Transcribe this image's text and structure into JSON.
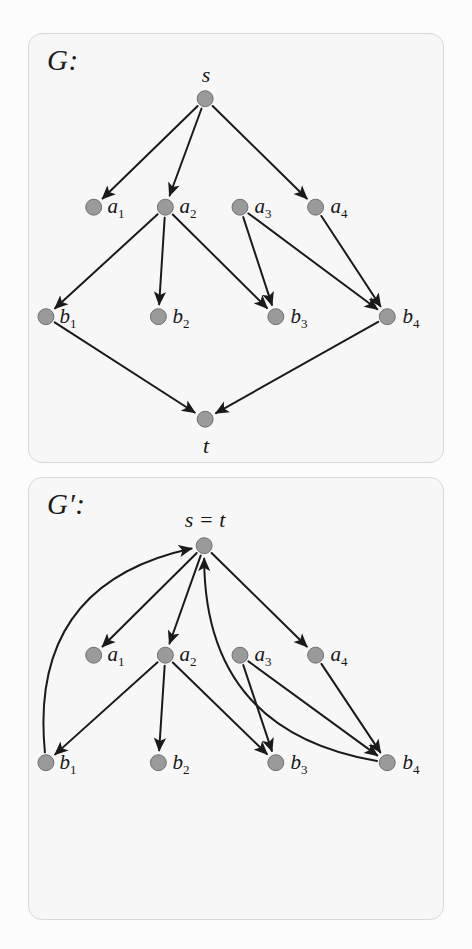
{
  "figure": {
    "kind": "directed-graph-pair",
    "background": "#fcfcfc",
    "panel_fill": "#f7f7f7",
    "panel_border": "#d8d8d8",
    "node_fill": "#9a9a9a",
    "node_stroke": "#6f6f6f",
    "edge_color": "#1a1a1a",
    "node_radius": 8
  },
  "panels": [
    {
      "id": "G",
      "title": "G:",
      "nodes": [
        {
          "id": "s",
          "label": "s",
          "sub": "",
          "x": 177,
          "y": 65,
          "label_dx": 0,
          "label_dy": -24
        },
        {
          "id": "a1",
          "label": "a",
          "sub": "1",
          "x": 65,
          "y": 174,
          "label_dx": 22,
          "label_dy": 0
        },
        {
          "id": "a2",
          "label": "a",
          "sub": "2",
          "x": 137,
          "y": 174,
          "label_dx": 22,
          "label_dy": 0
        },
        {
          "id": "a3",
          "label": "a",
          "sub": "3",
          "x": 212,
          "y": 174,
          "label_dx": 22,
          "label_dy": 0
        },
        {
          "id": "a4",
          "label": "a",
          "sub": "4",
          "x": 288,
          "y": 174,
          "label_dx": 22,
          "label_dy": 0
        },
        {
          "id": "b1",
          "label": "b",
          "sub": "1",
          "x": 17,
          "y": 284,
          "label_dx": 22,
          "label_dy": 0
        },
        {
          "id": "b2",
          "label": "b",
          "sub": "2",
          "x": 130,
          "y": 284,
          "label_dx": 22,
          "label_dy": 0
        },
        {
          "id": "b3",
          "label": "b",
          "sub": "3",
          "x": 248,
          "y": 284,
          "label_dx": 22,
          "label_dy": 0
        },
        {
          "id": "b4",
          "label": "b",
          "sub": "4",
          "x": 360,
          "y": 284,
          "label_dx": 22,
          "label_dy": 0
        },
        {
          "id": "t",
          "label": "t",
          "sub": "",
          "x": 177,
          "y": 387,
          "label_dx": 0,
          "label_dy": 25
        }
      ],
      "edges": [
        {
          "from": "s",
          "to": "a1",
          "curve": 0
        },
        {
          "from": "s",
          "to": "a2",
          "curve": 0
        },
        {
          "from": "s",
          "to": "a4",
          "curve": 0
        },
        {
          "from": "a2",
          "to": "b1",
          "curve": 0
        },
        {
          "from": "a2",
          "to": "b2",
          "curve": 0
        },
        {
          "from": "a2",
          "to": "b3",
          "curve": 0
        },
        {
          "from": "a3",
          "to": "b3",
          "curve": 0
        },
        {
          "from": "a3",
          "to": "b4",
          "curve": 0
        },
        {
          "from": "a4",
          "to": "b4",
          "curve": 0
        },
        {
          "from": "b1",
          "to": "t",
          "curve": 0
        },
        {
          "from": "b4",
          "to": "t",
          "curve": 0
        }
      ]
    },
    {
      "id": "Gprime",
      "title": "G′:",
      "merged_label": "s = t",
      "nodes": [
        {
          "id": "s",
          "label": "s = t",
          "sub": "",
          "x": 176,
          "y": 68,
          "label_dx": 0,
          "label_dy": -26
        },
        {
          "id": "a1",
          "label": "a",
          "sub": "1",
          "x": 65,
          "y": 178,
          "label_dx": 22,
          "label_dy": 0
        },
        {
          "id": "a2",
          "label": "a",
          "sub": "2",
          "x": 137,
          "y": 178,
          "label_dx": 22,
          "label_dy": 0
        },
        {
          "id": "a3",
          "label": "a",
          "sub": "3",
          "x": 212,
          "y": 178,
          "label_dx": 22,
          "label_dy": 0
        },
        {
          "id": "a4",
          "label": "a",
          "sub": "4",
          "x": 288,
          "y": 178,
          "label_dx": 22,
          "label_dy": 0
        },
        {
          "id": "b1",
          "label": "b",
          "sub": "1",
          "x": 17,
          "y": 286,
          "label_dx": 22,
          "label_dy": 0
        },
        {
          "id": "b2",
          "label": "b",
          "sub": "2",
          "x": 130,
          "y": 286,
          "label_dx": 22,
          "label_dy": 0
        },
        {
          "id": "b3",
          "label": "b",
          "sub": "3",
          "x": 248,
          "y": 286,
          "label_dx": 22,
          "label_dy": 0
        },
        {
          "id": "b4",
          "label": "b",
          "sub": "4",
          "x": 360,
          "y": 286,
          "label_dx": 22,
          "label_dy": 0
        }
      ],
      "edges": [
        {
          "from": "s",
          "to": "a1",
          "curve": 0
        },
        {
          "from": "s",
          "to": "a2",
          "curve": 0
        },
        {
          "from": "s",
          "to": "a4",
          "curve": 0
        },
        {
          "from": "a2",
          "to": "b1",
          "curve": 0
        },
        {
          "from": "a2",
          "to": "b2",
          "curve": 0
        },
        {
          "from": "a2",
          "to": "b3",
          "curve": 0
        },
        {
          "from": "a3",
          "to": "b3",
          "curve": 0
        },
        {
          "from": "a3",
          "to": "b4",
          "curve": 0
        },
        {
          "from": "a4",
          "to": "b4",
          "curve": 0
        },
        {
          "from": "b1",
          "to": "s",
          "curve": -120
        },
        {
          "from": "b4",
          "to": "s",
          "curve": -120
        }
      ]
    }
  ],
  "chart_data": {
    "type": "diagram",
    "graphs": [
      {
        "name": "G",
        "vertices": [
          "s",
          "a1",
          "a2",
          "a3",
          "a4",
          "b1",
          "b2",
          "b3",
          "b4",
          "t"
        ],
        "edges": [
          [
            "s",
            "a1"
          ],
          [
            "s",
            "a2"
          ],
          [
            "s",
            "a4"
          ],
          [
            "a2",
            "b1"
          ],
          [
            "a2",
            "b2"
          ],
          [
            "a2",
            "b3"
          ],
          [
            "a3",
            "b3"
          ],
          [
            "a3",
            "b4"
          ],
          [
            "a4",
            "b4"
          ],
          [
            "b1",
            "t"
          ],
          [
            "b4",
            "t"
          ]
        ],
        "directed": true
      },
      {
        "name": "G'",
        "vertices": [
          "s=t",
          "a1",
          "a2",
          "a3",
          "a4",
          "b1",
          "b2",
          "b3",
          "b4"
        ],
        "edges": [
          [
            "s=t",
            "a1"
          ],
          [
            "s=t",
            "a2"
          ],
          [
            "s=t",
            "a4"
          ],
          [
            "a2",
            "b1"
          ],
          [
            "a2",
            "b2"
          ],
          [
            "a2",
            "b3"
          ],
          [
            "a3",
            "b3"
          ],
          [
            "a3",
            "b4"
          ],
          [
            "a4",
            "b4"
          ],
          [
            "b1",
            "s=t"
          ],
          [
            "b4",
            "s=t"
          ]
        ],
        "directed": true,
        "note": "s and t identified into a single vertex; b1 and b4 edges curve back to it"
      }
    ]
  },
  "ghost_text_lines": [
    {
      "x": 36,
      "y": 44,
      "w": 170
    },
    {
      "x": 228,
      "y": 44,
      "w": 200
    },
    {
      "x": 36,
      "y": 63,
      "w": 392
    },
    {
      "x": 36,
      "y": 82,
      "w": 120
    },
    {
      "x": 36,
      "y": 130,
      "w": 392
    },
    {
      "x": 36,
      "y": 149,
      "w": 300
    },
    {
      "x": 36,
      "y": 196,
      "w": 392
    },
    {
      "x": 36,
      "y": 215,
      "w": 392
    },
    {
      "x": 36,
      "y": 234,
      "w": 392
    },
    {
      "x": 36,
      "y": 253,
      "w": 392
    },
    {
      "x": 36,
      "y": 272,
      "w": 392
    },
    {
      "x": 36,
      "y": 291,
      "w": 392
    },
    {
      "x": 36,
      "y": 310,
      "w": 392
    },
    {
      "x": 36,
      "y": 329,
      "w": 392
    },
    {
      "x": 36,
      "y": 348,
      "w": 260
    },
    {
      "x": 36,
      "y": 490,
      "w": 392
    },
    {
      "x": 36,
      "y": 509,
      "w": 392
    },
    {
      "x": 36,
      "y": 528,
      "w": 392
    },
    {
      "x": 36,
      "y": 547,
      "w": 392
    },
    {
      "x": 36,
      "y": 566,
      "w": 392
    },
    {
      "x": 36,
      "y": 585,
      "w": 392
    },
    {
      "x": 36,
      "y": 604,
      "w": 392
    },
    {
      "x": 36,
      "y": 623,
      "w": 392
    },
    {
      "x": 36,
      "y": 642,
      "w": 392
    },
    {
      "x": 36,
      "y": 661,
      "w": 392
    },
    {
      "x": 36,
      "y": 680,
      "w": 392
    },
    {
      "x": 36,
      "y": 699,
      "w": 392
    },
    {
      "x": 36,
      "y": 718,
      "w": 392
    },
    {
      "x": 36,
      "y": 737,
      "w": 392
    },
    {
      "x": 36,
      "y": 756,
      "w": 392
    },
    {
      "x": 36,
      "y": 775,
      "w": 392
    },
    {
      "x": 36,
      "y": 794,
      "w": 392
    },
    {
      "x": 36,
      "y": 813,
      "w": 392
    },
    {
      "x": 36,
      "y": 832,
      "w": 240
    },
    {
      "x": 36,
      "y": 876,
      "w": 392
    },
    {
      "x": 36,
      "y": 895,
      "w": 300
    }
  ]
}
